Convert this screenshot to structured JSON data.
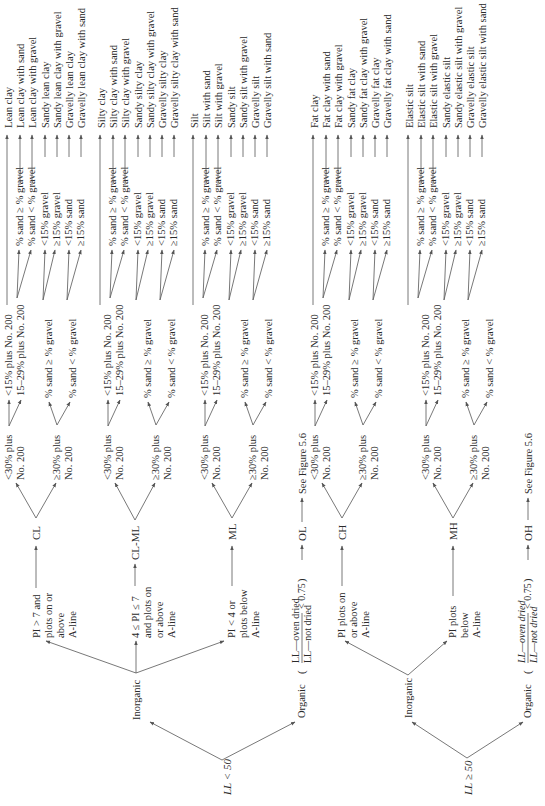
{
  "figure": {
    "orientation": "rotated 90 degrees counter-clockwise",
    "colors": {
      "ink": "#2a2a2a",
      "lines": "#555555",
      "background": "#ffffff"
    }
  },
  "roots": {
    "ll_lt_50": "LL < 50",
    "ll_ge_50": "LL ≥ 50"
  },
  "branches": {
    "inorganic": "Inorganic",
    "organic": "Organic",
    "organic_ratio_num": "LL—oven dried",
    "organic_ratio_den": "LL—not dried",
    "organic_ratio_cmp": "< 0.75"
  },
  "conditions_low": {
    "cl": [
      "PI > 7 and",
      "plots on or",
      "above",
      "A-line"
    ],
    "clml": [
      "4 ≤ PI ≤ 7",
      "and plots on",
      "or above",
      "A-line"
    ],
    "ml": [
      "PI < 4 or",
      "plots below",
      "A-line"
    ]
  },
  "conditions_high": {
    "ch": [
      "PI plots on",
      "or above",
      "A-line"
    ],
    "mh": [
      "PI plots",
      "below",
      "A-line"
    ]
  },
  "groups": {
    "cl": "CL",
    "clml": "CL-ML",
    "ml": "ML",
    "ol": "OL",
    "ch": "CH",
    "mh": "MH",
    "oh": "OH"
  },
  "see_figure": "See Figure 5.6",
  "fines": {
    "lt30": [
      "<30% plus",
      "No. 200"
    ],
    "ge30": [
      "≥30% plus",
      "No. 200"
    ],
    "lt15": "<15% plus No. 200",
    "r15_29": "15–29% plus No. 200",
    "sand_ge_gravel": "% sand ≥ % gravel",
    "sand_lt_gravel": "% sand < % gravel"
  },
  "leaf_conditions": [
    "% sand ≥ % gravel",
    "% sand < % gravel",
    "<15% gravel",
    "≥15% gravel",
    "<15% sand",
    "≥15% sand"
  ],
  "group_names": {
    "cl": [
      "Lean clay",
      "Lean clay with sand",
      "Lean clay with gravel",
      "Sandy lean clay",
      "Sandy lean clay with gravel",
      "Gravelly lean clay",
      "Gravelly lean clay with sand"
    ],
    "clml": [
      "Silty clay",
      "Silty clay with sand",
      "Silty clay with gravel",
      "Sandy silty clay",
      "Sandy silty clay with gravel",
      "Gravelly silty clay",
      "Gravelly silty clay with sand"
    ],
    "ml": [
      "Silt",
      "Silt with sand",
      "Silt with gravel",
      "Sandy silt",
      "Sandy silt with gravel",
      "Gravelly silt",
      "Gravelly silt with sand"
    ],
    "ch": [
      "Fat clay",
      "Fat clay with sand",
      "Fat clay with gravel",
      "Sandy fat clay",
      "Sandy fat clay with gravel",
      "Gravelly fat clay",
      "Gravelly fat clay with sand"
    ],
    "mh": [
      "Elastic silt",
      "Elastic silt with sand",
      "Elastic silt with gravel",
      "Sandy elastic silt",
      "Sandy elastic silt with gravel",
      "Gravelly elastic silt",
      "Gravelly elastic silt with sand"
    ]
  }
}
